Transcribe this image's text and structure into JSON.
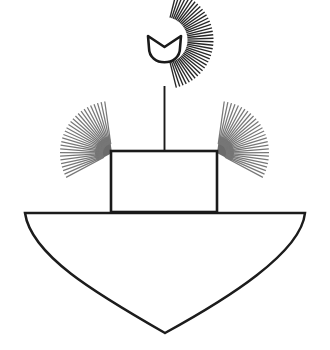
{
  "figure": {
    "title": "Line-art illustration of a vessel with radiating fan elements",
    "canvas": {
      "width": 330,
      "height": 350,
      "background_color": "#ffffff"
    },
    "palette": {
      "background": "#ffffff",
      "outline_dark": "#1a1a1a",
      "ray_dark": "#262626",
      "ray_gray": "#777777",
      "hub_gray": "#6b6b6b",
      "hull_stroke": "#1c1c1c"
    },
    "parts": [
      {
        "name": "top-fan",
        "kind": "radial-fan",
        "ray_count": 38,
        "center_x": 164.5,
        "center_y": 40,
        "inner_radius": 23,
        "outer_radius": 49,
        "start_angle_deg": -76,
        "end_angle_deg": 76,
        "ray_color": "#262626",
        "ray_width": 1.35
      },
      {
        "name": "top-bowl",
        "kind": "cup",
        "left_x": 148,
        "right_x": 181,
        "top_y": 36,
        "bottom_y": 63,
        "fill": "#ffffff",
        "stroke": "#1a1a1a",
        "stroke_width": 2.6
      },
      {
        "name": "mast-stem",
        "kind": "line",
        "x": 164.5,
        "top_y": 86,
        "bottom_y": 152,
        "stroke": "#1a1a1a",
        "stroke_width": 1.9
      },
      {
        "name": "cabin-box",
        "kind": "rect",
        "left_x": 111,
        "right_x": 217,
        "top_y": 151,
        "bottom_y": 212,
        "fill": "#ffffff",
        "stroke": "#1a1a1a",
        "stroke_width": 2.6
      },
      {
        "name": "left-wing-fan",
        "kind": "radial-fan",
        "ray_count": 28,
        "center_x": 112,
        "center_y": 153,
        "inner_radius": 9,
        "outer_radius": 52,
        "start_angle_deg": 152,
        "end_angle_deg": 262,
        "ray_color": "#777777",
        "ray_width": 1.25,
        "hub": {
          "radius": 17,
          "fill": "#6b6b6b"
        }
      },
      {
        "name": "right-wing-fan",
        "kind": "radial-fan",
        "ray_count": 28,
        "center_x": 217,
        "center_y": 153,
        "inner_radius": 9,
        "outer_radius": 52,
        "start_angle_deg": -82,
        "end_angle_deg": 28,
        "ray_color": "#777777",
        "ray_width": 1.25,
        "hub": {
          "radius": 17,
          "fill": "#6b6b6b"
        }
      },
      {
        "name": "hull",
        "kind": "path",
        "deck_left_x": 25,
        "deck_right_x": 305,
        "deck_y": 213,
        "keel_tip_x": 161,
        "keel_tip_y": 333,
        "fill": "#ffffff",
        "stroke": "#1c1c1c",
        "stroke_width": 2.5
      }
    ]
  }
}
